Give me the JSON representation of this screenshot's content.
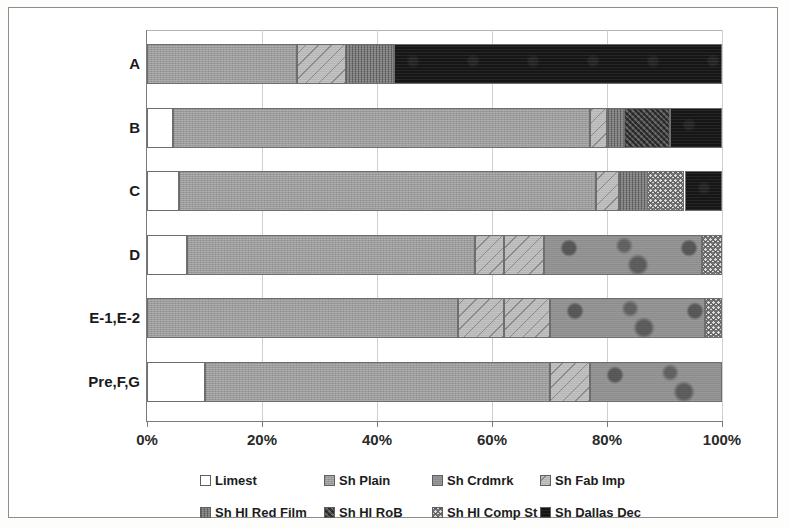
{
  "chart_data": {
    "type": "bar",
    "orientation": "horizontal",
    "stacked": true,
    "stack_mode": "percent",
    "title": "",
    "xlabel": "",
    "ylabel": "",
    "xlim": [
      0,
      100
    ],
    "grid": true,
    "legend_position": "bottom",
    "xtick_labels": [
      "0%",
      "20%",
      "40%",
      "60%",
      "80%",
      "100%"
    ],
    "xtick_values": [
      0,
      20,
      40,
      60,
      80,
      100
    ],
    "categories": [
      "A",
      "B",
      "C",
      "D",
      "E-1,E-2",
      "Pre,F,G"
    ],
    "series": [
      {
        "name": "Limest",
        "color": "#ffffff",
        "pattern": "solid-white",
        "values": [
          0,
          4.5,
          5.5,
          7,
          0,
          10
        ]
      },
      {
        "name": "Sh Plain",
        "color": "#9a9a9a",
        "pattern": "solid-grey",
        "values": [
          26,
          72.5,
          72.5,
          50,
          54,
          60
        ]
      },
      {
        "name": "Sh Crdmrk",
        "color": "#8b8b8b",
        "pattern": "mottled-grey",
        "values": [
          0,
          0,
          0,
          27.5,
          27,
          23
        ]
      },
      {
        "name": "Sh Fab Imp",
        "color": "#b6b6b6",
        "pattern": "diagonal-hatch",
        "values": [
          8.5,
          3,
          4,
          12,
          16,
          7
        ]
      },
      {
        "name": "Sh Hl Red Film",
        "color": "#7d7d7d",
        "pattern": "vertical-hatch",
        "values": [
          8.5,
          3,
          5,
          0,
          0,
          0
        ]
      },
      {
        "name": "Sh Hl RoB",
        "color": "#5a5a5a",
        "pattern": "dark-crosshatch",
        "values": [
          0,
          8,
          0,
          0,
          0,
          0
        ]
      },
      {
        "name": "Sh Hl Comp St",
        "color": "#dedede",
        "pattern": "light-checker",
        "values": [
          0,
          0,
          6.5,
          3.5,
          3,
          0
        ]
      },
      {
        "name": "Sh Dallas Dec",
        "color": "#161616",
        "pattern": "solid-black",
        "values": [
          57,
          9,
          6.5,
          0,
          0,
          0
        ]
      }
    ],
    "bars": [
      {
        "category": "A",
        "segments": [
          {
            "series": "Sh Plain",
            "start": 0,
            "size": 26,
            "fill": "f-shplain"
          },
          {
            "series": "Sh Fab Imp",
            "start": 26,
            "size": 8.5,
            "fill": "f-shfabimp"
          },
          {
            "series": "Sh Hl Red Film",
            "start": 34.5,
            "size": 8.5,
            "fill": "f-shhlredfilm"
          },
          {
            "series": "Sh Dallas Dec",
            "start": 43,
            "size": 57,
            "fill": "f-shdallasdec"
          }
        ]
      },
      {
        "category": "B",
        "segments": [
          {
            "series": "Limest",
            "start": 0,
            "size": 4.5,
            "fill": "f-limest"
          },
          {
            "series": "Sh Plain",
            "start": 4.5,
            "size": 72.5,
            "fill": "f-shplain"
          },
          {
            "series": "Sh Fab Imp",
            "start": 77,
            "size": 3,
            "fill": "f-shfabimp"
          },
          {
            "series": "Sh Hl Red Film",
            "start": 80,
            "size": 3,
            "fill": "f-shhlredfilm"
          },
          {
            "series": "Sh Hl RoB",
            "start": 83,
            "size": 8,
            "fill": "f-shhlrob"
          },
          {
            "series": "Sh Dallas Dec",
            "start": 91,
            "size": 9,
            "fill": "f-shdallasdec"
          }
        ]
      },
      {
        "category": "C",
        "segments": [
          {
            "series": "Limest",
            "start": 0,
            "size": 5.5,
            "fill": "f-limest"
          },
          {
            "series": "Sh Plain",
            "start": 5.5,
            "size": 72.5,
            "fill": "f-shplain"
          },
          {
            "series": "Sh Fab Imp",
            "start": 78,
            "size": 4,
            "fill": "f-shfabimp"
          },
          {
            "series": "Sh Hl Red Film",
            "start": 82,
            "size": 5,
            "fill": "f-shhlredfilm"
          },
          {
            "series": "Sh Hl Comp St",
            "start": 87,
            "size": 6.5,
            "fill": "f-shhlcompst"
          },
          {
            "series": "Sh Dallas Dec",
            "start": 93.5,
            "size": 6.5,
            "fill": "f-shdallasdec"
          }
        ]
      },
      {
        "category": "D",
        "segments": [
          {
            "series": "Limest",
            "start": 0,
            "size": 7,
            "fill": "f-limest"
          },
          {
            "series": "Sh Plain",
            "start": 7,
            "size": 50,
            "fill": "f-shplain"
          },
          {
            "series": "Sh Fab Imp",
            "start": 57,
            "size": 5,
            "fill": "f-shfabimp"
          },
          {
            "series": "Sh Fab Imp",
            "start": 62,
            "size": 7,
            "fill": "f-shfabimp"
          },
          {
            "series": "Sh Crdmrk",
            "start": 69,
            "size": 27.5,
            "fill": "f-shcrdmrk"
          },
          {
            "series": "Sh Hl Comp St",
            "start": 96.5,
            "size": 3.5,
            "fill": "f-shhlcompst"
          }
        ]
      },
      {
        "category": "E-1,E-2",
        "segments": [
          {
            "series": "Sh Plain",
            "start": 0,
            "size": 54,
            "fill": "f-shplain"
          },
          {
            "series": "Sh Fab Imp",
            "start": 54,
            "size": 8,
            "fill": "f-shfabimp"
          },
          {
            "series": "Sh Fab Imp",
            "start": 62,
            "size": 8,
            "fill": "f-shfabimp"
          },
          {
            "series": "Sh Crdmrk",
            "start": 70,
            "size": 27,
            "fill": "f-shcrdmrk"
          },
          {
            "series": "Sh Hl Comp St",
            "start": 97,
            "size": 3,
            "fill": "f-shhlcompst"
          }
        ]
      },
      {
        "category": "Pre,F,G",
        "segments": [
          {
            "series": "Limest",
            "start": 0,
            "size": 10,
            "fill": "f-limest"
          },
          {
            "series": "Sh Plain",
            "start": 10,
            "size": 60,
            "fill": "f-shplain"
          },
          {
            "series": "Sh Fab Imp",
            "start": 70,
            "size": 7,
            "fill": "f-shfabimp"
          },
          {
            "series": "Sh Crdmrk",
            "start": 77,
            "size": 23,
            "fill": "f-shcrdmrk"
          }
        ]
      }
    ],
    "legend": [
      {
        "label": "Limest",
        "fill": "f-limest"
      },
      {
        "label": "Sh Plain",
        "fill": "f-shplain"
      },
      {
        "label": "Sh Crdmrk",
        "fill": "f-shcrdmrk"
      },
      {
        "label": "Sh Fab Imp",
        "fill": "f-shfabimp"
      },
      {
        "label": "Sh Hl Red Film",
        "fill": "f-shhlredfilm"
      },
      {
        "label": "Sh Hl RoB",
        "fill": "f-shhlrob"
      },
      {
        "label": "Sh Hl Comp St",
        "fill": "f-shhlcompst"
      },
      {
        "label": "Sh Dallas Dec",
        "fill": "f-shdallasdec"
      }
    ]
  }
}
